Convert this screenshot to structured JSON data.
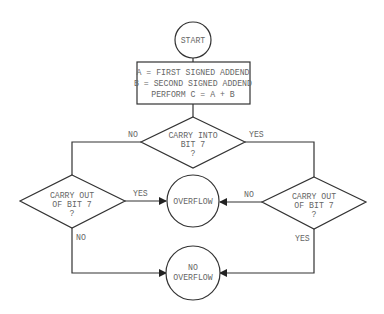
{
  "diagram": {
    "type": "flowchart",
    "title": "",
    "nodes": {
      "start": {
        "shape": "circle",
        "lines": [
          "START"
        ]
      },
      "process": {
        "shape": "rectangle",
        "lines": [
          "A = FIRST SIGNED ADDEND",
          "B = SECOND SIGNED ADDEND",
          "PERFORM C = A + B"
        ]
      },
      "carry_into": {
        "shape": "diamond",
        "lines": [
          "CARRY INTO",
          "BIT 7",
          "?"
        ]
      },
      "carry_out_left": {
        "shape": "diamond",
        "lines": [
          "CARRY OUT",
          "OF BIT 7",
          "?"
        ]
      },
      "carry_out_right": {
        "shape": "diamond",
        "lines": [
          "CARRY OUT",
          "OF BIT 7",
          "?"
        ]
      },
      "overflow": {
        "shape": "circle",
        "lines": [
          "OVERFLOW"
        ]
      },
      "no_overflow": {
        "shape": "circle",
        "lines": [
          "NO",
          "OVERFLOW"
        ]
      }
    },
    "edges": {
      "into_no": "NO",
      "into_yes": "YES",
      "left_yes": "YES",
      "left_no": "NO",
      "right_no": "NO",
      "right_yes": "YES"
    }
  }
}
